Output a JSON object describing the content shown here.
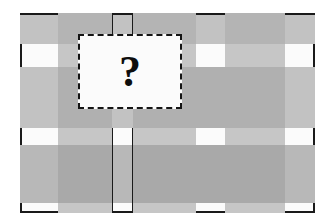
{
  "figure": {
    "background_color": "#ffffff",
    "width": 333,
    "height": 222,
    "colors": {
      "light_gray": "#c4c4c4",
      "mid_gray": "#b0b0b0",
      "dark_gray": "#a8a8a8",
      "white_band": "#fbfbfb",
      "near_white": "#f2f2f2",
      "edge_dark": "#1a1a1a",
      "occluder_fill": "#fbfbfb",
      "occluder_border": "#141414",
      "glyph_color": "#0d0d0d"
    }
  },
  "grid": {
    "column_edges": [
      20,
      58,
      112,
      133,
      196,
      225,
      285,
      315
    ],
    "row_edges": [
      13,
      44,
      67,
      128,
      145,
      203,
      213
    ],
    "column_types": [
      "gray",
      "gray",
      "light",
      "gray",
      "gray",
      "gray",
      "gray"
    ],
    "row_types": [
      "gray",
      "light",
      "gray",
      "light",
      "gray",
      "light"
    ],
    "columns": 7,
    "rows": 6
  },
  "cells": [
    {
      "c": 0,
      "r": 0,
      "shade": "#c2c2c2"
    },
    {
      "c": 1,
      "r": 0,
      "shade": "#b4b4b4"
    },
    {
      "c": 2,
      "r": 0,
      "shade": "#c2c2c2"
    },
    {
      "c": 3,
      "r": 0,
      "shade": "#b4b4b4"
    },
    {
      "c": 4,
      "r": 0,
      "shade": "#c2c2c2"
    },
    {
      "c": 5,
      "r": 0,
      "shade": "#b4b4b4"
    },
    {
      "c": 6,
      "r": 0,
      "shade": "#c2c2c2"
    },
    {
      "c": 0,
      "r": 1,
      "shade": "#fbfbfb"
    },
    {
      "c": 1,
      "r": 1,
      "shade": "#c6c6c6"
    },
    {
      "c": 2,
      "r": 1,
      "shade": "#fbfbfb"
    },
    {
      "c": 3,
      "r": 1,
      "shade": "#c6c6c6"
    },
    {
      "c": 4,
      "r": 1,
      "shade": "#fbfbfb"
    },
    {
      "c": 5,
      "r": 1,
      "shade": "#c6c6c6"
    },
    {
      "c": 6,
      "r": 1,
      "shade": "#fbfbfb"
    },
    {
      "c": 0,
      "r": 2,
      "shade": "#c2c2c2"
    },
    {
      "c": 1,
      "r": 2,
      "shade": "#b0b0b0"
    },
    {
      "c": 2,
      "r": 2,
      "shade": "#c2c2c2"
    },
    {
      "c": 3,
      "r": 2,
      "shade": "#b0b0b0"
    },
    {
      "c": 4,
      "r": 2,
      "shade": "#b0b0b0"
    },
    {
      "c": 5,
      "r": 2,
      "shade": "#b0b0b0"
    },
    {
      "c": 6,
      "r": 2,
      "shade": "#c2c2c2"
    },
    {
      "c": 0,
      "r": 3,
      "shade": "#fbfbfb"
    },
    {
      "c": 1,
      "r": 3,
      "shade": "#c6c6c6"
    },
    {
      "c": 2,
      "r": 3,
      "shade": "#fbfbfb"
    },
    {
      "c": 3,
      "r": 3,
      "shade": "#c6c6c6"
    },
    {
      "c": 4,
      "r": 3,
      "shade": "#fbfbfb"
    },
    {
      "c": 5,
      "r": 3,
      "shade": "#c6c6c6"
    },
    {
      "c": 6,
      "r": 3,
      "shade": "#fbfbfb"
    },
    {
      "c": 0,
      "r": 4,
      "shade": "#b8b8b8"
    },
    {
      "c": 1,
      "r": 4,
      "shade": "#a9a9a9"
    },
    {
      "c": 2,
      "r": 4,
      "shade": "#b8b8b8"
    },
    {
      "c": 3,
      "r": 4,
      "shade": "#a9a9a9"
    },
    {
      "c": 4,
      "r": 4,
      "shade": "#a9a9a9"
    },
    {
      "c": 5,
      "r": 4,
      "shade": "#a9a9a9"
    },
    {
      "c": 6,
      "r": 4,
      "shade": "#b8b8b8"
    },
    {
      "c": 0,
      "r": 5,
      "shade": "#fbfbfb"
    },
    {
      "c": 1,
      "r": 5,
      "shade": "#c6c6c6"
    },
    {
      "c": 2,
      "r": 5,
      "shade": "#fbfbfb"
    },
    {
      "c": 3,
      "r": 5,
      "shade": "#c6c6c6"
    },
    {
      "c": 4,
      "r": 5,
      "shade": "#fbfbfb"
    },
    {
      "c": 5,
      "r": 5,
      "shade": "#c6c6c6"
    },
    {
      "c": 6,
      "r": 5,
      "shade": "#fbfbfb"
    }
  ],
  "edges": [
    {
      "name": "top-segment-1",
      "x": 20,
      "y": 13,
      "w": 38,
      "h": 2
    },
    {
      "name": "top-segment-2",
      "x": 112,
      "y": 13,
      "w": 21,
      "h": 2
    },
    {
      "name": "top-segment-3",
      "x": 196,
      "y": 13,
      "w": 29,
      "h": 2
    },
    {
      "name": "top-segment-4",
      "x": 285,
      "y": 13,
      "w": 30,
      "h": 2
    },
    {
      "name": "left-segment-1",
      "x": 20,
      "y": 44,
      "w": 2,
      "h": 23
    },
    {
      "name": "left-segment-2",
      "x": 20,
      "y": 128,
      "w": 2,
      "h": 17
    },
    {
      "name": "left-segment-3",
      "x": 20,
      "y": 203,
      "w": 2,
      "h": 10
    },
    {
      "name": "right-segment-1",
      "x": 313,
      "y": 44,
      "w": 2,
      "h": 23
    },
    {
      "name": "right-segment-2",
      "x": 313,
      "y": 128,
      "w": 2,
      "h": 17
    },
    {
      "name": "right-segment-3",
      "x": 313,
      "y": 203,
      "w": 2,
      "h": 10
    },
    {
      "name": "bottom-segment-1",
      "x": 20,
      "y": 211,
      "w": 38,
      "h": 2
    },
    {
      "name": "bottom-segment-2",
      "x": 112,
      "y": 211,
      "w": 21,
      "h": 2
    },
    {
      "name": "bottom-segment-3",
      "x": 196,
      "y": 211,
      "w": 29,
      "h": 2
    },
    {
      "name": "bottom-segment-4",
      "x": 285,
      "y": 211,
      "w": 30,
      "h": 2
    },
    {
      "name": "col-divider-left-upper",
      "x": 112,
      "y": 13,
      "w": 1,
      "h": 31
    },
    {
      "name": "col-divider-right-upper",
      "x": 132,
      "y": 13,
      "w": 1,
      "h": 31
    },
    {
      "name": "col-divider-left-lower",
      "x": 112,
      "y": 128,
      "w": 1,
      "h": 85
    },
    {
      "name": "col-divider-right-lower",
      "x": 132,
      "y": 128,
      "w": 1,
      "h": 85
    }
  ],
  "occluder": {
    "name": "question-box",
    "x": 78,
    "y": 34,
    "width": 104,
    "height": 75,
    "border_style": "dashed",
    "glyph": "?",
    "glyph_font_size": 44
  }
}
